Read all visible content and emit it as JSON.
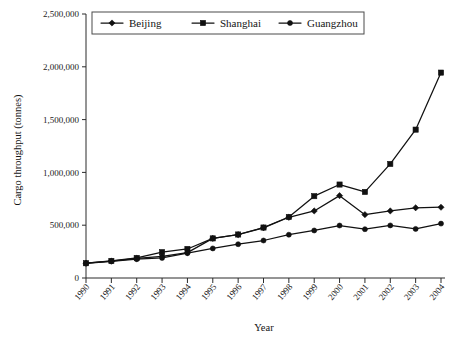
{
  "chart_data": {
    "type": "line",
    "title": "",
    "xlabel": "Year",
    "ylabel": "Cargo throughput (tonnes)",
    "categories": [
      "1990",
      "1991",
      "1992",
      "1993",
      "1994",
      "1995",
      "1996",
      "1997",
      "1998",
      "1999",
      "2000",
      "2001",
      "2002",
      "2003",
      "2004"
    ],
    "x": [
      1990,
      1991,
      1992,
      1993,
      1994,
      1995,
      1996,
      1997,
      1998,
      1999,
      2000,
      2001,
      2002,
      2003,
      2004
    ],
    "ylim": [
      0,
      2500000
    ],
    "xlim": [
      1990,
      2004
    ],
    "ytick_labels": [
      "0",
      "500,000",
      "1,000,000",
      "1,500,000",
      "2,000,000",
      "2,500,000"
    ],
    "ytick_values": [
      0,
      500000,
      1000000,
      1500000,
      2000000,
      2500000
    ],
    "grid": false,
    "legend_position": "top-center",
    "series": [
      {
        "name": "Beijing",
        "marker": "diamond",
        "color": "#111111",
        "values": [
          140000,
          160000,
          185000,
          205000,
          240000,
          375000,
          410000,
          475000,
          575000,
          635000,
          780000,
          600000,
          635000,
          665000,
          670000
        ]
      },
      {
        "name": "Shanghai",
        "marker": "square",
        "color": "#111111",
        "values": [
          140000,
          162000,
          190000,
          245000,
          275000,
          375000,
          412000,
          478000,
          578000,
          775000,
          885000,
          815000,
          1080000,
          1405000,
          1945000
        ]
      },
      {
        "name": "Guangzhou",
        "marker": "circle",
        "color": "#111111",
        "values": [
          138000,
          158000,
          178000,
          190000,
          235000,
          280000,
          320000,
          355000,
          410000,
          450000,
          497000,
          462000,
          498000,
          465000,
          515000
        ]
      }
    ]
  },
  "axes": {
    "x_title": "Year",
    "y_title": "Cargo throughput (tonnes)"
  },
  "legend": {
    "items": [
      {
        "label": "Beijing",
        "marker": "diamond-marker-icon"
      },
      {
        "label": "Shanghai",
        "marker": "square-marker-icon"
      },
      {
        "label": "Guangzhou",
        "marker": "circle-marker-icon"
      }
    ]
  }
}
